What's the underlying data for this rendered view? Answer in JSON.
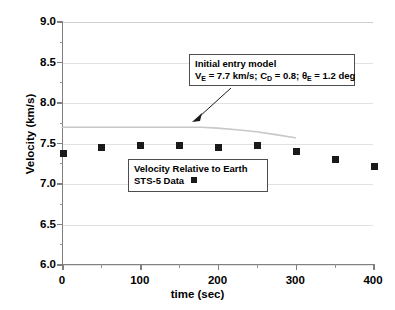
{
  "chart_data": {
    "type": "scatter",
    "title": "",
    "xlabel": "time (sec)",
    "ylabel": "Velocity (km/s)",
    "xlim": [
      0,
      400
    ],
    "ylim": [
      6.0,
      9.0
    ],
    "xticks": [
      "0",
      "100",
      "200",
      "300",
      "400"
    ],
    "xtick_values": [
      0,
      100,
      200,
      300,
      400
    ],
    "x_minor_step": 50,
    "yticks": [
      "6.0",
      "6.5",
      "7.0",
      "7.5",
      "8.0",
      "8.5",
      "9.0"
    ],
    "ytick_values": [
      6.0,
      6.5,
      7.0,
      7.5,
      8.0,
      8.5,
      9.0
    ],
    "y_minor_step": 0.25,
    "grid": true,
    "grid_axis": "y",
    "legend_position": "center",
    "series": [
      {
        "name": "STS-5 Data",
        "type": "scatter",
        "marker": "square",
        "color": "#1a1a1a",
        "x": [
          0,
          50,
          100,
          150,
          200,
          250,
          300,
          350,
          400
        ],
        "values": [
          7.38,
          7.45,
          7.47,
          7.47,
          7.45,
          7.47,
          7.4,
          7.3,
          7.21
        ]
      },
      {
        "name": "Initial entry model",
        "type": "line",
        "color": "#c8c8c8",
        "x": [
          0,
          50,
          100,
          150,
          180,
          200,
          225,
          250,
          275,
          300
        ],
        "values": [
          7.7,
          7.7,
          7.7,
          7.7,
          7.7,
          7.69,
          7.67,
          7.645,
          7.61,
          7.57
        ]
      }
    ],
    "annotations": [
      {
        "name": "initial-entry-model",
        "lines": [
          "Initial entry model",
          "V_E = 7.7 km/s; C_D = 0.8; theta_E = 1.2 deg"
        ],
        "arrow_from": [
          231,
          88
        ],
        "arrow_to": [
          196,
          120
        ]
      }
    ]
  },
  "axis": {
    "y_title": "Velocity (km/s)",
    "x_title": "time (sec)",
    "y_tick_labels": [
      "9.0",
      "8.5",
      "8.0",
      "7.5",
      "7.0",
      "6.5",
      "6.0"
    ],
    "x_tick_labels": [
      "0",
      "100",
      "200",
      "300",
      "400"
    ]
  },
  "model_callout": {
    "heading": "Initial entry model",
    "formula": {
      "v_symbol": "V",
      "v_sub": "E",
      "v_value": " = 7.7 km/s; C",
      "cd_sub": "D",
      "cd_value": " = 0.8; ",
      "theta_symbol": "θ",
      "theta_sub": "E",
      "theta_value": " = 1.2 deg"
    },
    "formula_plain": "V_E = 7.7 km/s; C_D = 0.8; θ_E = 1.2 deg"
  },
  "legend_callout": {
    "line1": "Velocity Relative to Earth",
    "line2": "STS-5  Data"
  },
  "colors": {
    "marker": "#1a1a1a",
    "model_curve": "#c8c8c8",
    "gridline": "#e2e2e2",
    "axis": "#808080",
    "callout_border": "#4d4d4d",
    "background": "#ffffff"
  }
}
